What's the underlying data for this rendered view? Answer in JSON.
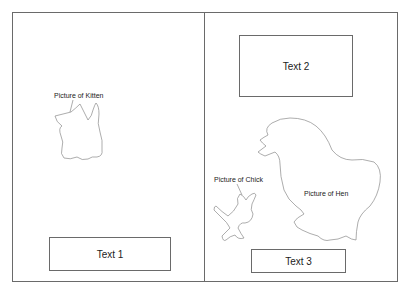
{
  "layout": {
    "panels": [
      {
        "id": "left",
        "textboxes": [
          {
            "label": "Text 1"
          }
        ],
        "pictures": [
          {
            "label": "Picture of Kitten"
          }
        ]
      },
      {
        "id": "right",
        "textboxes": [
          {
            "label": "Text 2"
          },
          {
            "label": "Text 3"
          }
        ],
        "pictures": [
          {
            "label": "Picture of Chick"
          },
          {
            "label": "Picture of Hen"
          }
        ]
      }
    ]
  },
  "colors": {
    "border": "#6a6a6a",
    "outline": "#8a8a8a",
    "text": "#222222",
    "background": "#ffffff"
  }
}
